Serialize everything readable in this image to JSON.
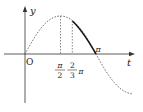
{
  "diagram": {
    "type": "function-graph",
    "function": "y = sin(t)",
    "axes": {
      "x_label": "t",
      "y_label": "y",
      "origin_label": "O"
    },
    "ticks": [
      {
        "name": "pi-over-2",
        "numerator": "π",
        "denominator": "2"
      },
      {
        "name": "two-thirds-pi",
        "numerator": "2",
        "denominator": "3",
        "suffix": "π"
      },
      {
        "name": "pi",
        "label": "π"
      }
    ],
    "highlighted_interval": [
      "2π/3",
      "π"
    ],
    "colors": {
      "axis": "#333333",
      "curve": "#444444",
      "highlight": "#111111"
    }
  }
}
